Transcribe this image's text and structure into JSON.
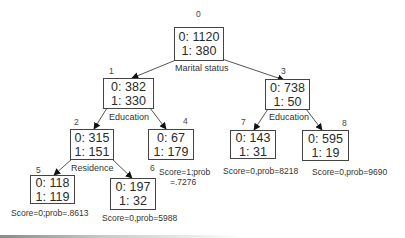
{
  "diagram": {
    "type": "decision-tree",
    "nodes": [
      {
        "id": "0",
        "class0": "0: 1120",
        "class1": "1: 380",
        "split": "Marital status"
      },
      {
        "id": "1",
        "class0": "0: 382",
        "class1": "1: 330",
        "split": "Education"
      },
      {
        "id": "2",
        "class0": "0: 315",
        "class1": "1: 151",
        "split": "Residence"
      },
      {
        "id": "3",
        "class0": "0: 738",
        "class1": "1: 50",
        "split": "Education"
      },
      {
        "id": "4",
        "class0": "0: 67",
        "class1": "1: 179",
        "score_line1": "Score=1;prob",
        "score_line2": "=.7276"
      },
      {
        "id": "5",
        "class0": "0: 118",
        "class1": "1: 119",
        "score": "Score=0;prob=.8613"
      },
      {
        "id": "6",
        "class0": "0: 197",
        "class1": "1: 32",
        "score": "Score=0,prob=5988"
      },
      {
        "id": "7",
        "class0": "0: 143",
        "class1": "1: 31",
        "score": "Score=0,prob=8218"
      },
      {
        "id": "8",
        "class0": "0: 595",
        "class1": "1: 19",
        "score": "Score=0,prob=9690"
      }
    ],
    "edges": [
      {
        "from": "0",
        "to": "1"
      },
      {
        "from": "0",
        "to": "3"
      },
      {
        "from": "1",
        "to": "2"
      },
      {
        "from": "1",
        "to": "4"
      },
      {
        "from": "2",
        "to": "5"
      },
      {
        "from": "2",
        "to": "6"
      },
      {
        "from": "3",
        "to": "7"
      },
      {
        "from": "3",
        "to": "8"
      }
    ],
    "colors": {
      "line": "#444444",
      "text": "#333333",
      "background": "#ffffff"
    }
  }
}
